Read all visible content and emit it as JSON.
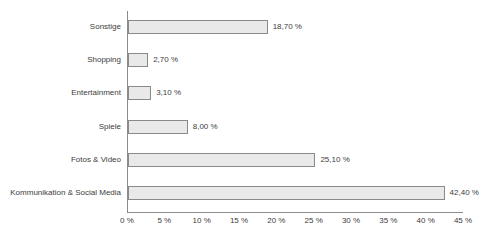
{
  "chart_data": {
    "type": "bar",
    "orientation": "horizontal",
    "title": "",
    "xlabel": "",
    "ylabel": "",
    "xlim": [
      0,
      45
    ],
    "grid": false,
    "legend": null,
    "categories": [
      "Sonstige",
      "Shopping",
      "Entertainment",
      "Spiele",
      "Fotos & Video",
      "Kommunikation & Social Media"
    ],
    "values": [
      18.7,
      2.7,
      3.1,
      8.0,
      25.1,
      42.4
    ],
    "value_labels": [
      "18,70 %",
      "2,70 %",
      "3,10 %",
      "8,00 %",
      "25,10 %",
      "42,40 %"
    ],
    "xticks": [
      0,
      5,
      10,
      15,
      20,
      25,
      30,
      35,
      40,
      45
    ],
    "xticklabels": [
      "0 %",
      "5 %",
      "10 %",
      "15 %",
      "20 %",
      "25 %",
      "30 %",
      "35 %",
      "40 %",
      "45 %"
    ],
    "colors": {
      "bar_fill": "#e9e9e9",
      "bar_border": "#8a8a8a",
      "axis": "#8c8c8c",
      "text": "#3c3c3c",
      "background": "#ffffff"
    }
  }
}
